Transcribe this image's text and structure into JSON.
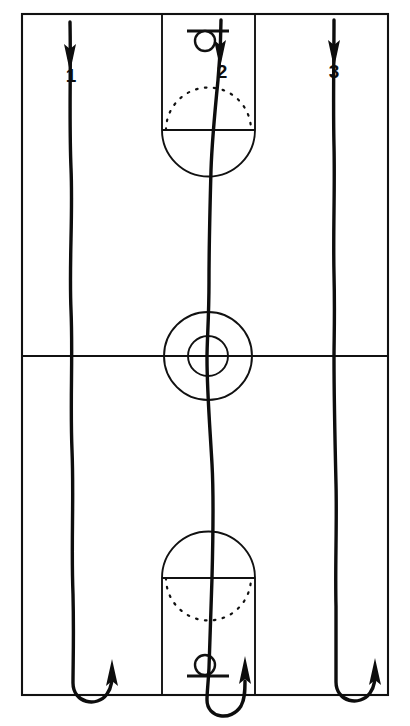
{
  "diagram": {
    "court_color": "#ffffff",
    "line_color": "#111111",
    "path_color": "#0d0d0d",
    "court": {
      "left": 22,
      "top": 14,
      "right": 388,
      "bottom": 695,
      "midcourt_line_y": 356,
      "center_x": 208
    },
    "center_circle": {
      "outer_radius": 44,
      "inner_radius": 20
    },
    "key_top": {
      "left": 162,
      "right": 255,
      "free_throw_line_y": 130,
      "solid_arc": "below",
      "dotted_arc": "above"
    },
    "key_bottom": {
      "left": 162,
      "right": 255,
      "free_throw_line_y": 578,
      "solid_arc": "above",
      "dotted_arc": "below"
    },
    "hoop_top": {
      "circle_cy": 41,
      "circle_r": 10,
      "backboard_y": 31,
      "backboard_half_width": 21
    },
    "hoop_bottom": {
      "circle_cy": 665,
      "circle_r": 10,
      "backboard_y": 676,
      "backboard_half_width": 21
    }
  },
  "players": [
    {
      "label": "1",
      "icon": "down-arrow-icon",
      "start_x": 70,
      "label_x": 71,
      "label_y": 76,
      "direction_start": "down",
      "direction_end": "up",
      "turn": "u-turn-at-baseline"
    },
    {
      "label": "2",
      "icon": "down-arrow-icon",
      "start_x": 221,
      "label_x": 222,
      "label_y": 72,
      "direction_start": "down",
      "direction_end": "up",
      "turn": "u-turn-at-baseline"
    },
    {
      "label": "3",
      "icon": "down-arrow-icon",
      "start_x": 334,
      "label_x": 334,
      "label_y": 72,
      "direction_start": "down",
      "direction_end": "up",
      "turn": "u-turn-at-baseline"
    }
  ]
}
